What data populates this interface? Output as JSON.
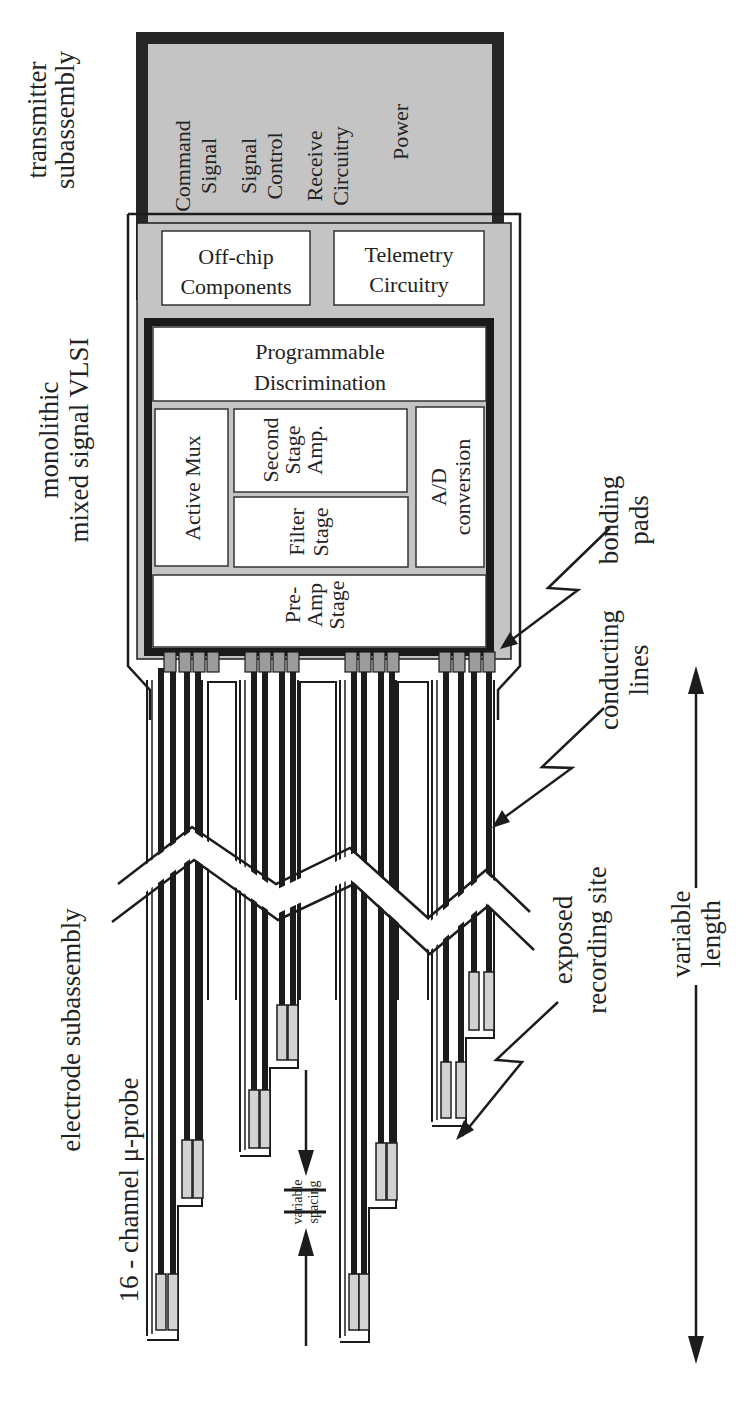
{
  "labels": {
    "transmitter": [
      "transmitter",
      "subassembly"
    ],
    "vlsi": [
      "monolithic",
      "mixed signal VLSI"
    ],
    "electrode": "electrode subassembly",
    "probe": "16 - channel μ-probe",
    "bonding_pads": [
      "bonding",
      "pads"
    ],
    "conducting_lines": [
      "conducting",
      "lines"
    ],
    "recording_site": [
      "exposed",
      "recording site"
    ],
    "variable_length": [
      "variable",
      "length"
    ],
    "variable_spacing": [
      "variable",
      "spacing"
    ]
  },
  "transmitter_blocks": [
    [
      "Command",
      "Signal"
    ],
    [
      "Signal",
      "Control"
    ],
    [
      "Receive",
      "Circuitry"
    ],
    [
      "Power"
    ]
  ],
  "package_blocks": {
    "off_chip": [
      "Off-chip",
      "Components"
    ],
    "telemetry": [
      "Telemetry",
      "Circuitry"
    ]
  },
  "chip_blocks": {
    "discrimination": [
      "Programmable",
      "Discrimination"
    ],
    "active_mux": "Active Mux",
    "second_stage": [
      "Second",
      "Stage",
      "Amp."
    ],
    "filter_stage": [
      "Filter",
      "Stage"
    ],
    "ad_conversion": [
      "A/D",
      "conversion"
    ],
    "preamp": [
      "Pre-",
      "Amp",
      "Stage"
    ]
  },
  "probe": {
    "channels": 16,
    "shanks": 4,
    "sites_per_shank": 4
  },
  "colors": {
    "ink": "#1c1c1c",
    "grey_fill": "#c4c4c4",
    "pad_fill": "#9c9c9c",
    "site_fill": "#d2d2d2",
    "paper": "#ffffff"
  }
}
